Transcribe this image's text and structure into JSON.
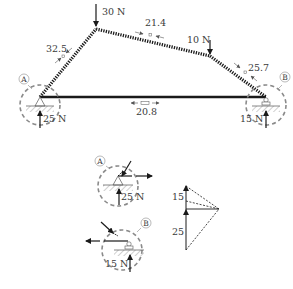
{
  "diagram": {
    "type": "truss-free-body-diagram",
    "colors": {
      "member": "#1a1a1a",
      "dashed_circle": "#8a8a8a",
      "text": "#3a3a3a",
      "hatch": "#888888"
    },
    "loads": {
      "top_load": "30 N",
      "right_load": "10 N"
    },
    "members": {
      "left_diagonal": "32.5",
      "top_chord": "21.4",
      "right_upper": "25.7",
      "bottom_chord": "20.8"
    },
    "supports": {
      "a_label": "A",
      "b_label": "B",
      "a_reaction": "25 N",
      "b_reaction": "15 N"
    },
    "detail_views": {
      "a_label": "A",
      "a_reaction": "25 N",
      "b_label": "B",
      "b_reaction": "15 N"
    },
    "force_polygon": {
      "upper_value": "15",
      "lower_value": "25"
    }
  }
}
